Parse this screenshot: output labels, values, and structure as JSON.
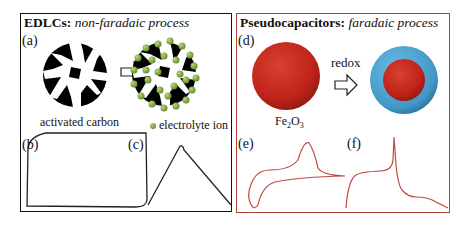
{
  "left_panel": {
    "title_bold": "EDLCs:",
    "title_italic": "non-faradaic process",
    "labels": {
      "a": "(a)",
      "b": "(b)",
      "c": "(c)"
    },
    "captions": {
      "material": "activated carbon",
      "legend": "electrolyte ion"
    },
    "colors": {
      "border": "#111111",
      "carbon": "#000000",
      "ion": "#7aa83a"
    }
  },
  "right_panel": {
    "title_bold": "Pseudocapacitors:",
    "title_italic": "faradaic process",
    "labels": {
      "d": "(d)",
      "e": "(e)",
      "f": "(f)"
    },
    "captions": {
      "arrow": "redox",
      "material_base": "Fe",
      "material_sub1": "2",
      "material_mid": "O",
      "material_sub2": "3"
    },
    "colors": {
      "border": "#b0403a",
      "sphere": "#c8281e",
      "shell": "#4aa3d0",
      "curve": "#c0493e"
    }
  }
}
